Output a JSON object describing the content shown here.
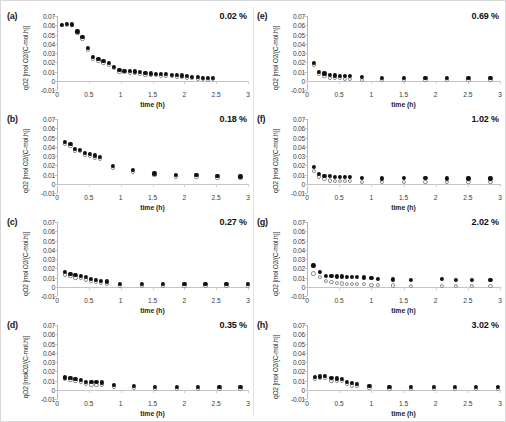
{
  "figure": {
    "panel_order": [
      "a",
      "b",
      "c",
      "d",
      "e",
      "f",
      "g",
      "h"
    ],
    "axis": {
      "xlabel": "time (h)",
      "ylabel_line1": "qO2",
      "ylabel_line2": "[mol O2/(C-mol.h)]",
      "ylabel_line2_alt": "[molO2/(C-mol.h)]",
      "xticks": [
        "0",
        "0.5",
        "1",
        "1.5",
        "2",
        "2.5",
        "3"
      ],
      "xtick_values": [
        0,
        0.5,
        1,
        1.5,
        2,
        2.5,
        3
      ],
      "yticks": [
        "0.07",
        "0.06",
        "0.05",
        "0.04",
        "0.03",
        "0.02",
        "0.01",
        "0",
        "-0.01"
      ],
      "ytick_values": [
        0.07,
        0.06,
        0.05,
        0.04,
        0.03,
        0.02,
        0.01,
        0,
        -0.01
      ],
      "xlim": [
        0,
        3
      ],
      "ylim": [
        -0.01,
        0.07
      ]
    },
    "series_names": [
      "filled",
      "open"
    ],
    "colors": {
      "filled_marker": "#111111",
      "open_marker_edge": "#8d8d8d",
      "open_marker_fill": "#fbfbfb",
      "axis": "#c4c4c4",
      "text": "#2b2b2b",
      "divider": "#e2e2e2"
    }
  },
  "chart_data": [
    {
      "type": "scatter",
      "panel": "a",
      "label": "(a)",
      "annotation": "0.02 %",
      "title": "",
      "xlabel": "time (h)",
      "ylabel": "qO2 [mol O2/(C-mol.h)]",
      "xlim": [
        0,
        3
      ],
      "ylim": [
        -0.01,
        0.07
      ],
      "grid": false,
      "legend": "none",
      "x": [
        0.08,
        0.16,
        0.24,
        0.32,
        0.4,
        0.48,
        0.57,
        0.65,
        0.73,
        0.81,
        0.89,
        0.98,
        1.06,
        1.14,
        1.22,
        1.3,
        1.39,
        1.47,
        1.55,
        1.63,
        1.71,
        1.8,
        1.88,
        1.96,
        2.04,
        2.12,
        2.21,
        2.29,
        2.37,
        2.45
      ],
      "series": [
        {
          "name": "filled",
          "marker": "filled-circle",
          "values": [
            0.0605,
            0.061,
            0.0608,
            0.0532,
            0.0475,
            0.035,
            0.0252,
            0.0232,
            0.0215,
            0.019,
            0.0152,
            0.0112,
            0.0108,
            0.0105,
            0.01,
            0.0092,
            0.0082,
            0.0078,
            0.0072,
            0.007,
            0.0068,
            0.0065,
            0.006,
            0.0055,
            0.005,
            0.0042,
            0.0038,
            0.003,
            0.0025,
            0.003
          ]
        },
        {
          "name": "open",
          "marker": "open-circle",
          "values": [
            0.0598,
            0.0602,
            0.0598,
            0.0512,
            0.0455,
            0.0332,
            0.0232,
            0.0212,
            0.0195,
            0.0172,
            0.0135,
            0.0095,
            0.0092,
            0.0088,
            0.0082,
            0.0075,
            0.0065,
            0.0062,
            0.0058,
            0.0055,
            0.0052,
            0.005,
            0.0045,
            0.004,
            0.0035,
            0.0028,
            0.0022,
            0.0015,
            0.0012,
            0.0015
          ]
        }
      ]
    },
    {
      "type": "scatter",
      "panel": "b",
      "label": "(b)",
      "annotation": "0.18 %",
      "xlabel": "time (h)",
      "ylabel": "qO2 [mol O2/(C-mol.h)]",
      "xlim": [
        0,
        3
      ],
      "ylim": [
        -0.01,
        0.07
      ],
      "grid": false,
      "legend": "none",
      "x": [
        0.13,
        0.21,
        0.28,
        0.36,
        0.44,
        0.52,
        0.6,
        0.68,
        0.88,
        1.19,
        1.53,
        1.87,
        2.19,
        2.52,
        2.88
      ],
      "series": [
        {
          "name": "filled",
          "marker": "filled-circle",
          "values": [
            0.0448,
            0.0428,
            0.0372,
            0.0368,
            0.033,
            0.0318,
            0.0305,
            0.0292,
            0.0188,
            0.0145,
            0.011,
            0.0098,
            0.009,
            0.0082,
            0.0078
          ]
        },
        {
          "name": "open",
          "marker": "open-circle",
          "values": [
            0.0428,
            0.0408,
            0.0355,
            0.0352,
            0.0308,
            0.0295,
            0.0282,
            0.027,
            0.0168,
            0.0125,
            0.009,
            0.0078,
            0.0072,
            0.0065,
            0.0062
          ]
        }
      ]
    },
    {
      "type": "scatter",
      "panel": "c",
      "label": "(c)",
      "annotation": "0.27 %",
      "xlabel": "time (h)",
      "ylabel": "qO2 [mol O2/(C-mol.h)]",
      "xlim": [
        0,
        3
      ],
      "ylim": [
        -0.01,
        0.07
      ],
      "grid": false,
      "legend": "none",
      "x": [
        0.13,
        0.21,
        0.29,
        0.37,
        0.45,
        0.53,
        0.61,
        0.69,
        0.78,
        0.99,
        1.33,
        1.66,
        2.0,
        2.33,
        2.66,
        3.0
      ],
      "series": [
        {
          "name": "filled",
          "marker": "filled-circle",
          "values": [
            0.016,
            0.014,
            0.0125,
            0.0118,
            0.0105,
            0.0085,
            0.007,
            0.006,
            0.0055,
            0.003,
            0.0028,
            0.0028,
            0.0028,
            0.0028,
            0.0028,
            0.0028
          ]
        },
        {
          "name": "open",
          "marker": "open-circle",
          "values": [
            0.0132,
            0.0115,
            0.01,
            0.0092,
            0.0078,
            0.006,
            0.0048,
            0.004,
            0.0035,
            0.0012,
            0.001,
            0.001,
            0.001,
            0.001,
            0.001,
            0.001
          ]
        }
      ]
    },
    {
      "type": "scatter",
      "panel": "d",
      "label": "(d)",
      "annotation": "0.35 %",
      "xlabel": "time (h)",
      "ylabel": "qO2 [molO2/(C-mol.h)]",
      "xlim": [
        0,
        3
      ],
      "ylim": [
        -0.01,
        0.07
      ],
      "grid": false,
      "legend": "none",
      "x": [
        0.13,
        0.21,
        0.29,
        0.37,
        0.46,
        0.54,
        0.62,
        0.7,
        0.9,
        1.21,
        1.54,
        1.88,
        2.21,
        2.55,
        2.88
      ],
      "series": [
        {
          "name": "filled",
          "marker": "filled-circle",
          "values": [
            0.0132,
            0.0125,
            0.0118,
            0.0108,
            0.0085,
            0.0082,
            0.008,
            0.0078,
            0.005,
            0.0038,
            0.003,
            0.003,
            0.0028,
            0.0025,
            0.0028
          ]
        },
        {
          "name": "open",
          "marker": "open-circle",
          "values": [
            0.0112,
            0.0102,
            0.0095,
            0.0082,
            0.0058,
            0.0055,
            0.0052,
            0.005,
            0.0025,
            0.0015,
            0.001,
            0.001,
            0.0008,
            0.0008,
            0.0008
          ]
        }
      ]
    },
    {
      "type": "scatter",
      "panel": "e",
      "label": "(e)",
      "annotation": "0.69 %",
      "xlabel": "time (h)",
      "ylabel": "qO2 [mol O2/(C-mol.h)]",
      "xlim": [
        0,
        3
      ],
      "ylim": [
        -0.01,
        0.07
      ],
      "grid": false,
      "legend": "none",
      "x": [
        0.11,
        0.19,
        0.27,
        0.35,
        0.43,
        0.51,
        0.59,
        0.67,
        0.85,
        1.17,
        1.5,
        1.84,
        2.17,
        2.51,
        2.85
      ],
      "series": [
        {
          "name": "filled",
          "marker": "filled-circle",
          "values": [
            0.0192,
            0.0098,
            0.0078,
            0.006,
            0.0055,
            0.0052,
            0.005,
            0.0048,
            0.0038,
            0.003,
            0.003,
            0.003,
            0.003,
            0.003,
            0.003
          ]
        },
        {
          "name": "open",
          "marker": "open-circle",
          "values": [
            0.017,
            0.0075,
            0.0052,
            0.0032,
            0.0028,
            0.0025,
            0.0022,
            0.002,
            0.001,
            0.0005,
            0.0005,
            0.0005,
            0.0005,
            0.0005,
            0.0005
          ]
        }
      ]
    },
    {
      "type": "scatter",
      "panel": "f",
      "label": "(f)",
      "annotation": "1.02 %",
      "xlabel": "time (h)",
      "ylabel": "qO2 [mol O2/(C-mol.h)]",
      "xlim": [
        0,
        3
      ],
      "ylim": [
        -0.01,
        0.07
      ],
      "grid": false,
      "legend": "none",
      "x": [
        0.11,
        0.19,
        0.27,
        0.35,
        0.43,
        0.51,
        0.59,
        0.67,
        0.85,
        1.17,
        1.51,
        1.84,
        2.17,
        2.51,
        2.85
      ],
      "series": [
        {
          "name": "filled",
          "marker": "filled-circle",
          "values": [
            0.0178,
            0.0105,
            0.0085,
            0.008,
            0.0075,
            0.0072,
            0.007,
            0.0068,
            0.0058,
            0.0055,
            0.0058,
            0.0058,
            0.0055,
            0.0055,
            0.0055
          ]
        },
        {
          "name": "open",
          "marker": "open-circle",
          "values": [
            0.0135,
            0.0078,
            0.0048,
            0.0035,
            0.003,
            0.0028,
            0.0028,
            0.0028,
            0.0018,
            0.0015,
            0.0015,
            0.0015,
            0.0015,
            0.0015,
            0.0015
          ]
        }
      ]
    },
    {
      "type": "scatter",
      "panel": "g",
      "label": "(g)",
      "annotation": "2.02 %",
      "xlabel": "time (h)",
      "ylabel": "qO2 [mol O2/(C-mol.h)]",
      "xlim": [
        0,
        3
      ],
      "ylim": [
        -0.01,
        0.07
      ],
      "grid": false,
      "legend": "none",
      "x": [
        0.1,
        0.2,
        0.3,
        0.38,
        0.46,
        0.54,
        0.62,
        0.7,
        0.78,
        0.88,
        1.0,
        1.1,
        1.33,
        1.62,
        2.1,
        2.32,
        2.56,
        2.85
      ],
      "series": [
        {
          "name": "filled",
          "marker": "filled-circle",
          "values": [
            0.0228,
            0.0158,
            0.0118,
            0.0112,
            0.011,
            0.011,
            0.0108,
            0.0105,
            0.0102,
            0.01,
            0.0098,
            0.0085,
            0.0078,
            0.0075,
            0.0085,
            0.0072,
            0.0068,
            0.0068
          ]
        },
        {
          "name": "open",
          "marker": "open-circle",
          "values": [
            0.0142,
            0.0102,
            0.0062,
            0.0048,
            0.004,
            0.0035,
            0.0032,
            0.003,
            0.0028,
            0.0025,
            0.0022,
            0.002,
            0.0012,
            0.001,
            0.0008,
            0.0008,
            0.0008,
            0.0008
          ]
        }
      ]
    },
    {
      "type": "scatter",
      "panel": "h",
      "label": "(h)",
      "annotation": "3.02 %",
      "xlabel": "time (h)",
      "ylabel": "qO2 [mol O2/(C-mol.h)]",
      "xlim": [
        0,
        3
      ],
      "ylim": [
        -0.01,
        0.07
      ],
      "grid": false,
      "legend": "none",
      "x": [
        0.12,
        0.2,
        0.28,
        0.38,
        0.46,
        0.54,
        0.62,
        0.7,
        0.78,
        0.97,
        1.28,
        1.62,
        1.97,
        2.3,
        2.63,
        2.97
      ],
      "series": [
        {
          "name": "filled",
          "marker": "filled-circle",
          "values": [
            0.0135,
            0.0142,
            0.0145,
            0.0122,
            0.012,
            0.0118,
            0.0082,
            0.0068,
            0.0062,
            0.004,
            0.003,
            0.0028,
            0.0028,
            0.0028,
            0.0025,
            0.003
          ]
        },
        {
          "name": "open",
          "marker": "open-circle",
          "values": [
            0.0118,
            0.0122,
            0.0122,
            0.0098,
            0.0095,
            0.0092,
            0.0058,
            0.0045,
            0.004,
            0.0018,
            0.001,
            0.0008,
            0.0008,
            0.0008,
            0.0008,
            0.0008
          ]
        }
      ]
    }
  ]
}
